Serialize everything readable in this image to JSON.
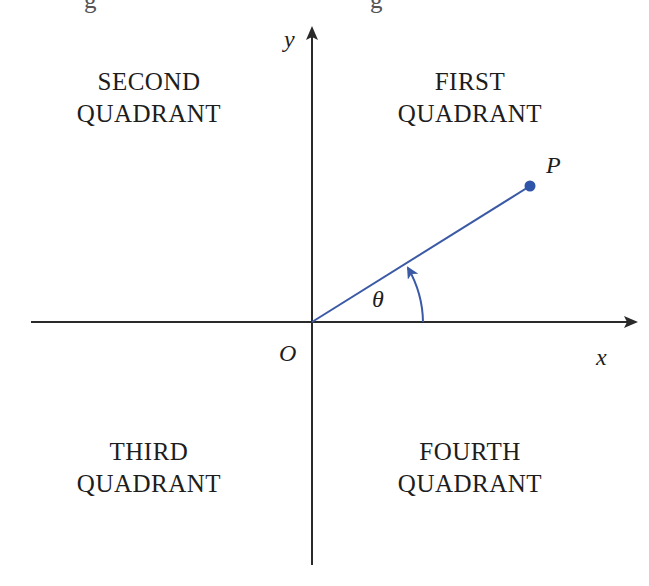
{
  "figure": {
    "type": "coordinate-plane-quadrants",
    "top_cut_text_fragments": [
      "g",
      "g"
    ],
    "quadrants": {
      "first": {
        "line1": "FIRST",
        "line2": "QUADRANT"
      },
      "second": {
        "line1": "SECOND",
        "line2": "QUADRANT"
      },
      "third": {
        "line1": "THIRD",
        "line2": "QUADRANT"
      },
      "fourth": {
        "line1": "FOURTH",
        "line2": "QUADRANT"
      }
    },
    "axes": {
      "x_label": "x",
      "y_label": "y",
      "origin_label": "O"
    },
    "point": {
      "label": "P"
    },
    "angle": {
      "label": "θ"
    },
    "colors": {
      "axis": "#2a2a2a",
      "ray": "#3b5aa6",
      "point": "#2f55a8",
      "text": "#1d1d1d"
    }
  }
}
